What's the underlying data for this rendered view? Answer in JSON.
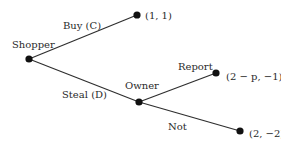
{
  "tree": {
    "players": {
      "root": "Shopper",
      "second": "Owner"
    },
    "edges": {
      "buy": "Buy (C)",
      "steal": "Steal (D)",
      "report": "Report",
      "not": "Not"
    },
    "payoffs": {
      "buy": "(1, 1)",
      "report": "(2 − p, −1)",
      "not": "(2, −2)"
    }
  }
}
